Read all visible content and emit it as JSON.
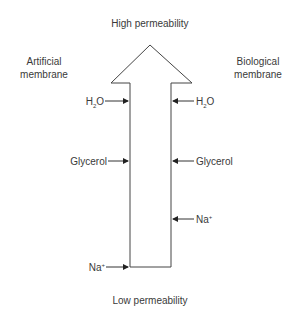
{
  "title_top": "High permeability",
  "title_bottom": "Low permeability",
  "left_heading": [
    "Artificial",
    "membrane"
  ],
  "right_heading": [
    "Biological",
    "membrane"
  ],
  "left_molecules": [
    {
      "name": "H",
      "sub": "2",
      "suffix": "O",
      "y": 101
    },
    {
      "name": "Glycerol",
      "y": 161
    },
    {
      "name": "Na",
      "sup": "+",
      "y": 267
    }
  ],
  "right_molecules": [
    {
      "name": "H",
      "sub": "2",
      "suffix": "O",
      "y": 101
    },
    {
      "name": "Glycerol",
      "y": 161
    },
    {
      "name": "Na",
      "sup": "+",
      "y": 219
    }
  ],
  "colors": {
    "line": "#444444",
    "text": "#3a3a3a"
  }
}
